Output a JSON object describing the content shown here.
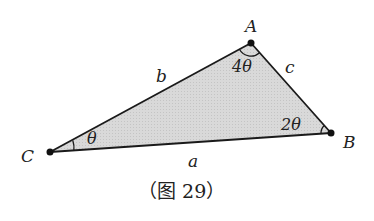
{
  "diagram": {
    "type": "triangle",
    "vertices": {
      "A": {
        "label": "A",
        "x": 251,
        "y": 43
      },
      "B": {
        "label": "B",
        "x": 331,
        "y": 133
      },
      "C": {
        "label": "C",
        "x": 50,
        "y": 152
      }
    },
    "sides": {
      "a": "a",
      "b": "b",
      "c": "c"
    },
    "angles": {
      "A": "4θ",
      "B": "2θ",
      "C": "θ"
    },
    "caption": "（图 29）",
    "colors": {
      "fill": "#d6d6d6",
      "stroke": "#1a1a1a",
      "text": "#222222"
    }
  }
}
